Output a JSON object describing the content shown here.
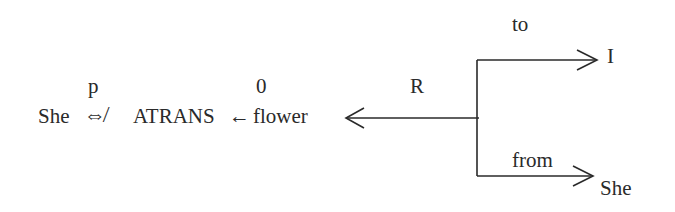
{
  "diagram": {
    "actor": "She",
    "actor_mode_label": "p",
    "link_symbol": "⇎",
    "primitive": "ATRANS",
    "object_mode_label": "0",
    "object_arrow": "←",
    "object": "flower",
    "recipient_label": "R",
    "to_label": "to",
    "to_value": "I",
    "from_label": "from",
    "from_value": "She"
  },
  "colors": {
    "ink": "#2a2a2a",
    "background": "#ffffff"
  }
}
